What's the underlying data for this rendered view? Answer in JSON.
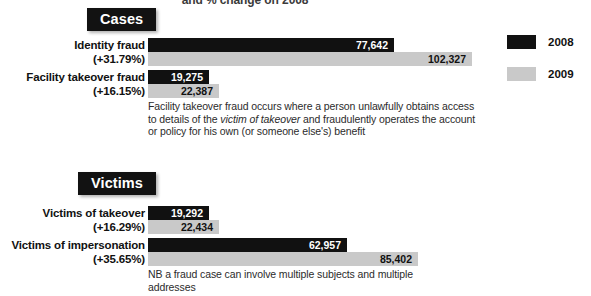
{
  "chart_data": {
    "type": "bar",
    "title": "and % change on 2008",
    "orientation": "horizontal",
    "xlabel": "",
    "ylabel": "",
    "grid": false,
    "legend_position": "right",
    "axis_max": 112000,
    "legend": [
      {
        "name": "2008",
        "color": "#111111"
      },
      {
        "name": "2009",
        "color": "#c9c9c9"
      }
    ],
    "sections": [
      {
        "name": "Cases",
        "note": "Facility takeover fraud occurs where a person unlawfully obtains access to details of the victim of takeover and fraudulently operates the account or policy for his own (or someone else's) benefit",
        "note_italic": "victim of takeover",
        "rows": [
          {
            "label": "Identity fraud",
            "change": "(+31.79%)",
            "v2008": 77642,
            "v2009": 102327,
            "v2008_label": "77,642",
            "v2009_label": "102,327"
          },
          {
            "label": "Facility takeover fraud",
            "change": "(+16.15%)",
            "v2008": 19275,
            "v2009": 22387,
            "v2008_label": "19,275",
            "v2009_label": "22,387"
          }
        ]
      },
      {
        "name": "Victims",
        "note": "NB a fraud case can involve multiple subjects and multiple addresses",
        "rows": [
          {
            "label": "Victims of takeover",
            "change": "(+16.29%)",
            "v2008": 19292,
            "v2009": 22434,
            "v2008_label": "19,292",
            "v2009_label": "22,434"
          },
          {
            "label": "Victims of impersonation",
            "change": "(+35.65%)",
            "v2008": 62957,
            "v2009": 85402,
            "v2008_label": "62,957",
            "v2009_label": "85,402"
          }
        ]
      }
    ]
  }
}
